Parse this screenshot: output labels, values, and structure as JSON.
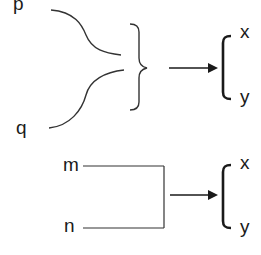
{
  "diagram": {
    "top": {
      "inputs": [
        "p",
        "q"
      ],
      "combiner": "curly-brace",
      "outputs": [
        "x",
        "y"
      ]
    },
    "bottom": {
      "inputs": [
        "m",
        "n"
      ],
      "combiner": "square-connector",
      "outputs": [
        "x",
        "y"
      ]
    }
  },
  "colors": {
    "stroke": "#333333",
    "text": "#1a1a1a",
    "background": "#ffffff"
  }
}
